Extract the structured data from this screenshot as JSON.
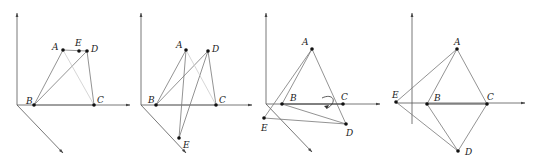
{
  "figure": {
    "panels": [
      {
        "id": 1,
        "points": [
          {
            "label": "A",
            "x": 63,
            "y": 50,
            "lx": 52,
            "ly": 50
          },
          {
            "label": "E",
            "x": 79,
            "y": 51,
            "lx": 75,
            "ly": 46
          },
          {
            "label": "D",
            "x": 87,
            "y": 51,
            "lx": 91,
            "ly": 52
          },
          {
            "label": "B",
            "x": 34,
            "y": 105,
            "lx": 26,
            "ly": 104
          },
          {
            "label": "C",
            "x": 94,
            "y": 105,
            "lx": 97,
            "ly": 103
          }
        ]
      },
      {
        "id": 2,
        "points": [
          {
            "label": "A",
            "x": 186,
            "y": 50,
            "lx": 176,
            "ly": 48
          },
          {
            "label": "D",
            "x": 208,
            "y": 51,
            "lx": 212,
            "ly": 52
          },
          {
            "label": "B",
            "x": 156,
            "y": 105,
            "lx": 148,
            "ly": 103
          },
          {
            "label": "C",
            "x": 216,
            "y": 105,
            "lx": 219,
            "ly": 103
          },
          {
            "label": "E",
            "x": 179,
            "y": 138,
            "lx": 183,
            "ly": 148
          }
        ]
      },
      {
        "id": 3,
        "points": [
          {
            "label": "A",
            "x": 312,
            "y": 49,
            "lx": 302,
            "ly": 45
          },
          {
            "label": "B",
            "x": 282,
            "y": 104,
            "lx": 290,
            "ly": 101
          },
          {
            "label": "C",
            "x": 343,
            "y": 104,
            "lx": 341,
            "ly": 100
          },
          {
            "label": "D",
            "x": 346,
            "y": 124,
            "lx": 346,
            "ly": 136
          },
          {
            "label": "E",
            "x": 264,
            "y": 118,
            "lx": 261,
            "ly": 131
          }
        ]
      },
      {
        "id": 4,
        "points": [
          {
            "label": "A",
            "x": 457,
            "y": 49,
            "lx": 454,
            "ly": 45
          },
          {
            "label": "B",
            "x": 427,
            "y": 104,
            "lx": 434,
            "ly": 101
          },
          {
            "label": "C",
            "x": 487,
            "y": 104,
            "lx": 487,
            "ly": 100
          },
          {
            "label": "D",
            "x": 458,
            "y": 151,
            "lx": 465,
            "ly": 155
          },
          {
            "label": "E",
            "x": 396,
            "y": 102,
            "lx": 392,
            "ly": 98
          }
        ]
      }
    ]
  }
}
